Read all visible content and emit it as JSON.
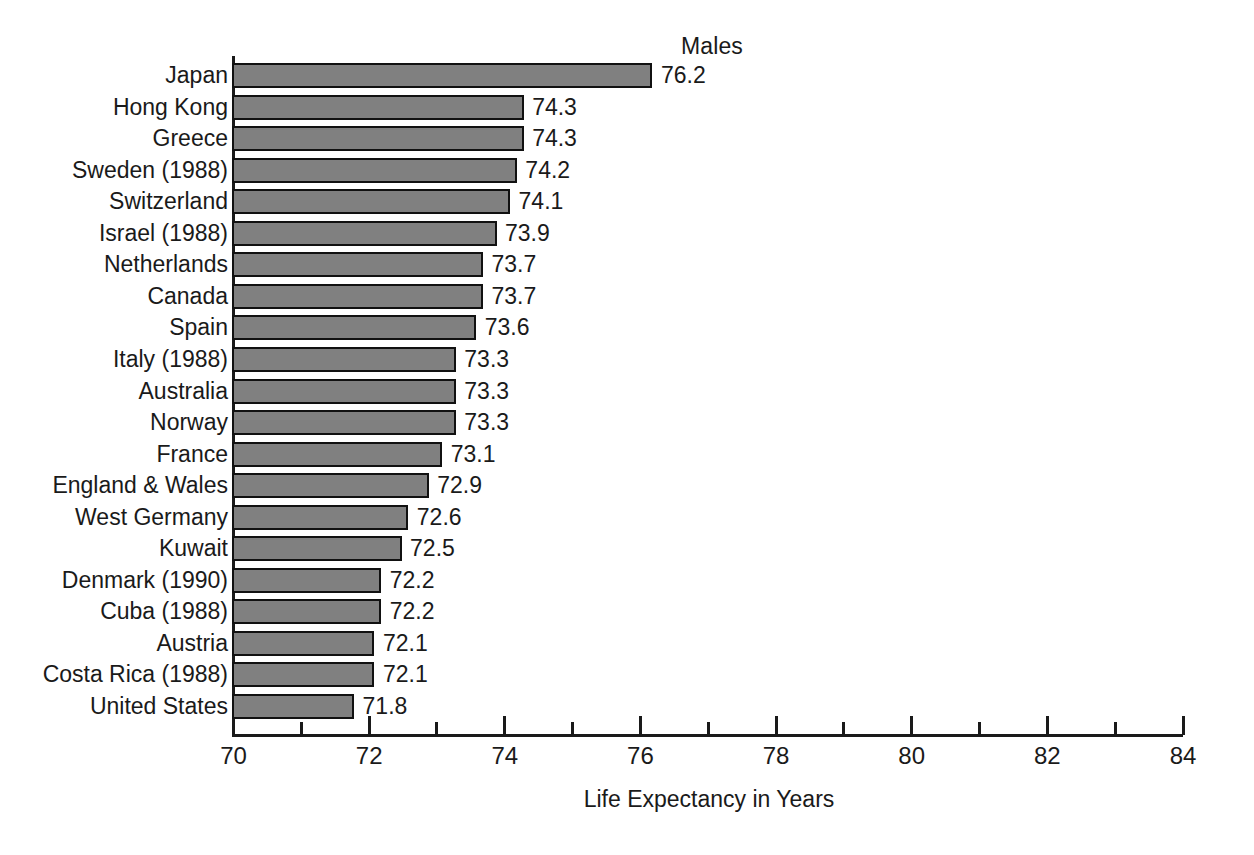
{
  "chart_data": {
    "type": "bar",
    "orientation": "horizontal",
    "title": "Males",
    "xlabel": "Life Expectancy in Years",
    "ylabel": "",
    "xlim": [
      70,
      84
    ],
    "grid": false,
    "legend": "none",
    "bar_color": "#808080",
    "bar_border_color": "#111111",
    "axis_color": "#1a1a1a",
    "background": "#ffffff",
    "major_ticks": [
      70,
      72,
      74,
      76,
      78,
      80,
      82,
      84
    ],
    "minor_ticks": [
      71,
      73,
      75,
      77,
      79,
      81,
      83
    ],
    "tick_labels": [
      "70",
      "72",
      "74",
      "76",
      "78",
      "80",
      "82",
      "84"
    ],
    "categories": [
      "Japan",
      "Hong Kong",
      "Greece",
      "Sweden (1988)",
      "Switzerland",
      "Israel (1988)",
      "Netherlands",
      "Canada",
      "Spain",
      "Italy (1988)",
      "Australia",
      "Norway",
      "France",
      "England & Wales",
      "West Germany",
      "Kuwait",
      "Denmark (1990)",
      "Cuba (1988)",
      "Austria",
      "Costa Rica (1988)",
      "United States"
    ],
    "values": [
      76.2,
      74.3,
      74.3,
      74.2,
      74.1,
      73.9,
      73.7,
      73.7,
      73.6,
      73.3,
      73.3,
      73.3,
      73.1,
      72.9,
      72.6,
      72.5,
      72.2,
      72.2,
      72.1,
      72.1,
      71.8
    ],
    "value_labels": [
      "76.2",
      "74.3",
      "74.3",
      "74.2",
      "74.1",
      "73.9",
      "73.7",
      "73.7",
      "73.6",
      "73.3",
      "73.3",
      "73.3",
      "73.1",
      "72.9",
      "72.6",
      "72.5",
      "72.2",
      "72.2",
      "72.1",
      "72.1",
      "71.8"
    ]
  }
}
